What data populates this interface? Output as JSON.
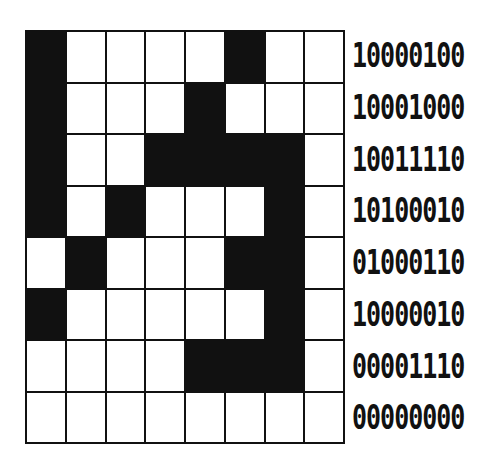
{
  "diagram": {
    "title": "",
    "grid_size": {
      "rows": 8,
      "cols": 8
    },
    "fill_color": "#111111",
    "empty_color": "#ffffff",
    "rows": [
      {
        "bits": "10000100"
      },
      {
        "bits": "10001000"
      },
      {
        "bits": "10011110"
      },
      {
        "bits": "10100010"
      },
      {
        "bits": "01000110"
      },
      {
        "bits": "10000010"
      },
      {
        "bits": "00001110"
      },
      {
        "bits": "00000000"
      }
    ]
  }
}
